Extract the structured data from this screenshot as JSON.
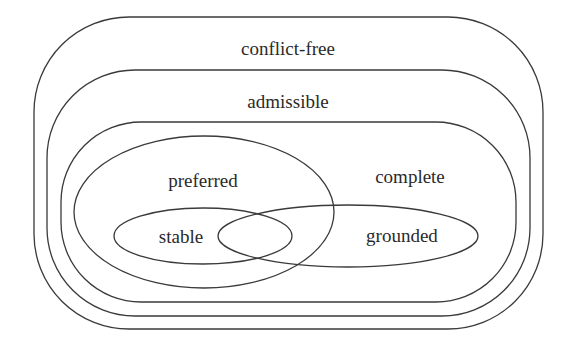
{
  "diagram": {
    "type": "nested-set-diagram",
    "background": "#ffffff",
    "stroke_color": "#3a3a3a",
    "text_color": "#2a2a2a",
    "sets": [
      {
        "id": "conflict-free",
        "label": "conflict-free",
        "shape": "rounded-rect",
        "x": 34,
        "y": 17,
        "w": 509,
        "h": 312,
        "r": 95,
        "label_x": 288,
        "label_y": 55
      },
      {
        "id": "admissible",
        "label": "admissible",
        "shape": "rounded-rect",
        "x": 47,
        "y": 70,
        "w": 483,
        "h": 246,
        "r": 88,
        "label_x": 288,
        "label_y": 108
      },
      {
        "id": "complete",
        "label": "complete",
        "shape": "rounded-rect",
        "x": 61,
        "y": 122,
        "w": 455,
        "h": 180,
        "r": 80,
        "label_x": 410,
        "label_y": 183
      },
      {
        "id": "preferred",
        "label": "preferred",
        "shape": "ellipse",
        "cx": 204,
        "cy": 212,
        "rx": 130,
        "ry": 76,
        "label_x": 203,
        "label_y": 187
      },
      {
        "id": "stable",
        "label": "stable",
        "shape": "ellipse",
        "cx": 203,
        "cy": 236,
        "rx": 89,
        "ry": 28,
        "label_x": 181,
        "label_y": 243
      },
      {
        "id": "grounded",
        "label": "grounded",
        "shape": "ellipse",
        "cx": 348,
        "cy": 236,
        "rx": 130,
        "ry": 31,
        "label_x": 402,
        "label_y": 242
      }
    ]
  }
}
